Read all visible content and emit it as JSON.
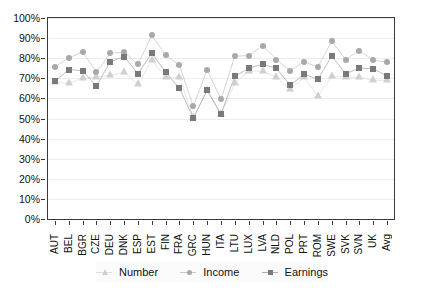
{
  "chart_data": {
    "type": "line",
    "title": "",
    "xlabel": "",
    "ylabel": "",
    "ylim": [
      0,
      100
    ],
    "ytick_labels": [
      "0%",
      "10%",
      "20%",
      "30%",
      "40%",
      "50%",
      "60%",
      "70%",
      "80%",
      "90%",
      "100%"
    ],
    "ytick_values": [
      0,
      10,
      20,
      30,
      40,
      50,
      60,
      70,
      80,
      90,
      100
    ],
    "grid": true,
    "legend_position": "bottom",
    "categories": [
      "AUT",
      "BEL",
      "BGR",
      "CZE",
      "DEU",
      "DNK",
      "ESP",
      "EST",
      "FIN",
      "FRA",
      "GRC",
      "HUN",
      "ITA",
      "LTU",
      "LUX",
      "LVA",
      "NLD",
      "POL",
      "PRT",
      "ROM",
      "SWE",
      "SVK",
      "SVN",
      "UK",
      "Avg"
    ],
    "series": [
      {
        "name": "Number",
        "marker": "triangle",
        "color": "#cfcfcf",
        "values": [
          68.0,
          67.5,
          70.0,
          70.5,
          71.5,
          73.0,
          67.0,
          79.0,
          70.5,
          70.5,
          50.5,
          64.0,
          52.0,
          67.5,
          73.5,
          73.5,
          70.5,
          64.5,
          70.5,
          61.0,
          71.0,
          70.5,
          70.5,
          69.0,
          69.0
        ]
      },
      {
        "name": "Income",
        "marker": "circle",
        "color": "#a9a9a9",
        "values": [
          75.8,
          80.0,
          83.3,
          73.0,
          82.5,
          83.0,
          77.0,
          91.3,
          81.5,
          76.5,
          56.0,
          74.3,
          59.5,
          81.0,
          81.3,
          86.2,
          79.3,
          73.8,
          78.3,
          75.6,
          88.5,
          79.3,
          83.8,
          79.0,
          78.0
        ]
      },
      {
        "name": "Earnings",
        "marker": "square",
        "color": "#7a7a7a",
        "values": [
          68.5,
          74.3,
          73.8,
          66.0,
          78.3,
          80.8,
          72.3,
          82.5,
          73.0,
          65.0,
          50.3,
          64.0,
          52.3,
          71.0,
          75.0,
          77.0,
          75.0,
          66.5,
          72.0,
          69.5,
          81.0,
          72.3,
          75.0,
          74.8,
          71.0
        ]
      }
    ]
  },
  "legend": {
    "items": [
      {
        "label": "Number"
      },
      {
        "label": "Income"
      },
      {
        "label": "Earnings"
      }
    ]
  },
  "colors": {
    "number": "#cfcfcf",
    "income": "#a9a9a9",
    "earnings": "#7a7a7a",
    "axis": "#3a3a3a",
    "grid": "#ededed",
    "text": "#111111"
  }
}
